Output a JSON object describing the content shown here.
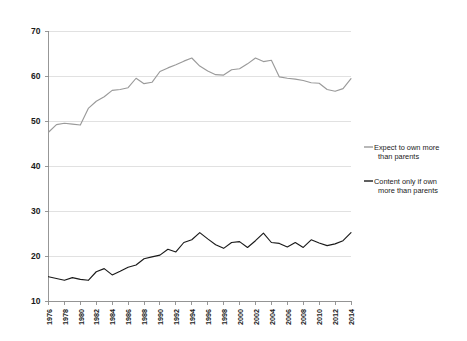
{
  "chart_data": {
    "type": "line",
    "title": "",
    "subtitle": "",
    "xlabel": "",
    "ylabel": "",
    "ylim": [
      10,
      70
    ],
    "ytick_labels": [
      "70",
      "60",
      "50",
      "40",
      "30",
      "20",
      "10"
    ],
    "ytick_values": [
      70,
      60,
      50,
      40,
      30,
      20,
      10
    ],
    "grid": true,
    "legend_position": "right",
    "x": [
      1976,
      1977,
      1978,
      1979,
      1980,
      1981,
      1982,
      1983,
      1984,
      1985,
      1986,
      1987,
      1988,
      1989,
      1990,
      1991,
      1992,
      1993,
      1994,
      1995,
      1996,
      1997,
      1998,
      1999,
      2000,
      2001,
      2002,
      2003,
      2004,
      2005,
      2006,
      2007,
      2008,
      2009,
      2010,
      2011,
      2012,
      2013,
      2014
    ],
    "xtick_labels": [
      "1976",
      "1978",
      "1980",
      "1982",
      "1984",
      "1986",
      "1988",
      "1990",
      "1992",
      "1994",
      "1996",
      "1998",
      "2000",
      "2002",
      "2004",
      "2006",
      "2008",
      "2010",
      "2012",
      "2014"
    ],
    "xtick_values": [
      1976,
      1978,
      1980,
      1982,
      1984,
      1986,
      1988,
      1990,
      1992,
      1994,
      1996,
      1998,
      2000,
      2002,
      2004,
      2006,
      2008,
      2010,
      2012,
      2014
    ],
    "series": [
      {
        "name": "Expect to own more than parents",
        "color": "#9a9a9a",
        "values": [
          47.5,
          49.2,
          49.5,
          49.3,
          49.1,
          52.8,
          54.4,
          55.4,
          56.8,
          57.0,
          57.4,
          59.5,
          58.3,
          58.6,
          61.0,
          61.8,
          62.5,
          63.3,
          64.0,
          62.2,
          61.1,
          60.3,
          60.2,
          61.4,
          61.6,
          62.7,
          64.0,
          63.2,
          63.5,
          59.8,
          59.5,
          59.3,
          59.0,
          58.5,
          58.4,
          57.0,
          56.6,
          57.2,
          59.4
        ],
        "legend_label_line1": "Expect to own more",
        "legend_label_line2": "than parents"
      },
      {
        "name": "Content only if own more than parents",
        "color": "#1a1a1a",
        "values": [
          15.4,
          15.0,
          14.6,
          15.2,
          14.8,
          14.6,
          16.5,
          17.2,
          15.8,
          16.6,
          17.5,
          18.0,
          19.4,
          19.8,
          20.2,
          21.5,
          20.9,
          23.0,
          23.6,
          25.2,
          23.8,
          22.5,
          21.7,
          23.0,
          23.2,
          21.9,
          23.4,
          25.1,
          23.0,
          22.8,
          22.0,
          23.0,
          21.9,
          23.6,
          22.9,
          22.3,
          22.7,
          23.4,
          25.2
        ],
        "legend_label_line1": "Content only if own",
        "legend_label_line2": "more than parents"
      }
    ]
  },
  "colors": {
    "series_gray": "#9a9a9a",
    "series_black": "#1a1a1a",
    "gridline": "#d9d9d9",
    "axis": "#8c8c8c",
    "background": "#ffffff",
    "text": "#1a1a1a"
  }
}
